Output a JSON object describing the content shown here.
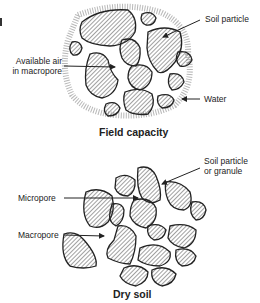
{
  "panels": [
    {
      "title": "Field capacity",
      "labels": {
        "soil_particle": "Soil particle",
        "available_air_line1": "Available air",
        "available_air_line2": "in macropore",
        "water": "Water"
      }
    },
    {
      "title": "Dry soil",
      "labels": {
        "soil_particle_line1": "Soil particle",
        "soil_particle_line2": "or granule",
        "micropore": "Micropore",
        "macropore": "Macropore"
      }
    }
  ],
  "colors": {
    "particle_outline": "#222222",
    "hatch": "#444444",
    "water": "#888888",
    "text": "#222222"
  }
}
